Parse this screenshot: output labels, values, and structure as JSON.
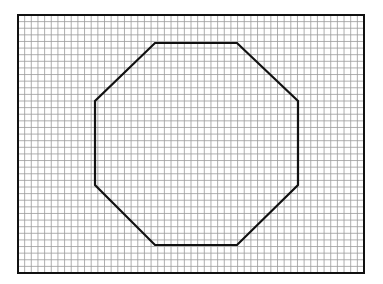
{
  "figure": {
    "background": "#ffffff",
    "grid": {
      "x0": 18,
      "y0": 15,
      "x1": 364,
      "y1": 273,
      "cols": 52,
      "rows": 39,
      "line_color": "#9a9a9a",
      "border_color": "#111111"
    },
    "shape": {
      "type": "octagon",
      "stroke": "#111111",
      "points": [
        [
          155,
          43
        ],
        [
          237,
          43
        ],
        [
          298,
          101
        ],
        [
          298,
          185
        ],
        [
          237,
          245
        ],
        [
          155,
          245
        ],
        [
          95,
          185
        ],
        [
          95,
          101
        ]
      ]
    }
  }
}
